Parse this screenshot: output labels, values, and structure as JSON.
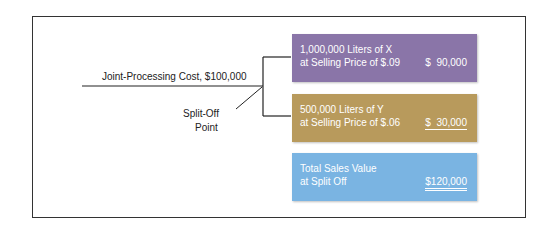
{
  "diagram": {
    "cost_label": "Joint-Processing Cost, $100,000",
    "split_off_label_line1": "Split-Off",
    "split_off_label_line2": "Point",
    "products": [
      {
        "line1": "1,000,000 Liters of X",
        "line2": "at Selling Price of $.09",
        "value": "$  90,000",
        "color": "#8a75a8"
      },
      {
        "line1": "500,000 Liters of Y",
        "line2": "at Selling Price of $.06",
        "value": "$  30,000",
        "color": "#b89a5c"
      }
    ],
    "total": {
      "line1": "Total Sales Value",
      "line2": "at Split Off",
      "value": "$120,000",
      "color": "#7ab4e2"
    }
  }
}
